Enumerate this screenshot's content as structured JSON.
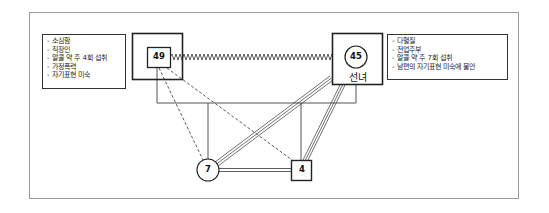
{
  "genogram": {
    "husband": {
      "age": "49",
      "notes": [
        "- 소심함",
        "- 직장인",
        "- 알콜 약 주 4회 섭취",
        "- 가정폭력",
        "- 자기표현 미숙"
      ]
    },
    "wife": {
      "age": "45",
      "label": "선녀",
      "notes": [
        "- 다혈질",
        "- 전업주부",
        "- 알콜 약 주 7회 섭취",
        "- 남편의 자기표현 미숙에 불안"
      ]
    },
    "children": [
      {
        "age": "7",
        "shape": "circle"
      },
      {
        "age": "4",
        "shape": "square"
      }
    ],
    "relationships": {
      "husband_wife": "conflict (zigzag)",
      "husband_children": "distant (dashed)",
      "wife_children": "fused (triple line)",
      "siblings": "close (double line)"
    },
    "colors": {
      "line": "#333333",
      "frame": "#9a9a9a"
    }
  }
}
